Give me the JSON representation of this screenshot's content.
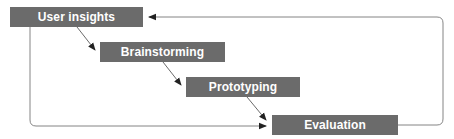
{
  "diagram": {
    "type": "iterative-process-flow",
    "colors": {
      "box_fill": "#6b6b6b",
      "box_text": "#ffffff",
      "line": "#555555",
      "background": "#ffffff"
    },
    "nodes": [
      {
        "id": "user_insights",
        "label": "User insights"
      },
      {
        "id": "brainstorming",
        "label": "Brainstorming"
      },
      {
        "id": "prototyping",
        "label": "Prototyping"
      },
      {
        "id": "evaluation",
        "label": "Evaluation"
      }
    ],
    "edges": [
      {
        "from": "user_insights",
        "to": "brainstorming"
      },
      {
        "from": "brainstorming",
        "to": "prototyping"
      },
      {
        "from": "prototyping",
        "to": "evaluation"
      },
      {
        "from": "user_insights",
        "to": "evaluation",
        "style": "loop-left-bottom"
      },
      {
        "from": "evaluation",
        "to": "user_insights",
        "style": "loop-right-top"
      }
    ]
  }
}
